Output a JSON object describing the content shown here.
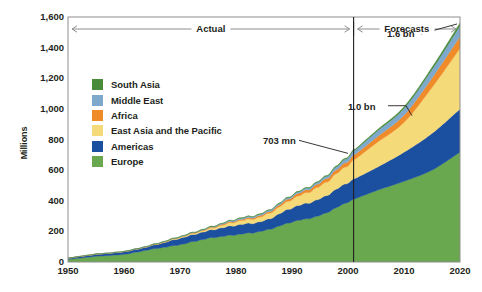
{
  "chart_data": {
    "type": "area",
    "title": "",
    "subtitle": "",
    "xlabel": "",
    "ylabel": "Millions",
    "xlim": [
      1950,
      2020
    ],
    "ylim": [
      0,
      1600
    ],
    "grid": false,
    "stacked": true,
    "legend_position": "inside-upper-left",
    "x_tick_labels": [
      "1950",
      "1960",
      "1970",
      "1980",
      "1990",
      "2000",
      "2010",
      "2020"
    ],
    "x_ticks": [
      1950,
      1960,
      1970,
      1980,
      1990,
      2000,
      2010,
      2020
    ],
    "y_tick_labels": [
      "0",
      "200",
      "400",
      "600",
      "800",
      "1,000",
      "1,200",
      "1,400",
      "1,600"
    ],
    "y_ticks": [
      0,
      200,
      400,
      600,
      800,
      1000,
      1200,
      1400,
      1600
    ],
    "x": [
      1950,
      1955,
      1960,
      1965,
      1970,
      1975,
      1980,
      1985,
      1990,
      1995,
      2000,
      2005,
      2010,
      2015,
      2020
    ],
    "series": [
      {
        "name": "Europe",
        "color": "#6aa84f",
        "values": [
          16.8,
          36.8,
          50.4,
          83.7,
          113.0,
          153.9,
          178.5,
          204.3,
          261.5,
          304.1,
          392.5,
          465.0,
          527.0,
          600.0,
          717.0
        ]
      },
      {
        "name": "Americas",
        "color": "#1b4fa0",
        "values": [
          7.5,
          12.8,
          16.7,
          23.2,
          42.3,
          50.0,
          62.3,
          65.1,
          92.8,
          109.0,
          128.2,
          150.0,
          190.0,
          240.0,
          282.0
        ]
      },
      {
        "name": "East Asia and the Pacific",
        "color": "#f5da7a",
        "values": [
          0.2,
          0.6,
          0.9,
          2.1,
          6.2,
          10.2,
          23.0,
          32.9,
          56.2,
          82.4,
          114.9,
          160.0,
          195.0,
          300.0,
          397.0
        ]
      },
      {
        "name": "Africa",
        "color": "#f08b2a",
        "values": [
          0.5,
          0.8,
          0.8,
          1.4,
          2.4,
          4.7,
          7.2,
          9.7,
          15.2,
          20.4,
          28.3,
          37.0,
          47.0,
          62.0,
          77.0
        ]
      },
      {
        "name": "Middle East",
        "color": "#7fa9cc",
        "values": [
          0.2,
          0.3,
          0.6,
          1.3,
          1.9,
          3.5,
          7.5,
          9.0,
          10.0,
          14.0,
          25.2,
          36.0,
          44.0,
          55.0,
          69.0
        ]
      },
      {
        "name": "South Asia",
        "color": "#4a8b3b",
        "values": [
          0.2,
          0.3,
          0.3,
          0.6,
          0.9,
          1.8,
          2.2,
          2.5,
          3.2,
          4.2,
          6.1,
          8.0,
          11.0,
          14.0,
          19.0
        ]
      }
    ],
    "annotations": [
      {
        "label": "703 mn",
        "x": 2000,
        "y": 703
      },
      {
        "label": "1.0 bn",
        "x": 2010,
        "y": 1014
      },
      {
        "label": "1.6 bn",
        "x": 2020,
        "y": 1561
      }
    ],
    "period_spans": [
      {
        "label": "Actual",
        "from": 1950,
        "to": 2001
      },
      {
        "label": "Forecasts",
        "from": 2001,
        "to": 2020
      }
    ],
    "divider_year": 2001
  },
  "legend": {
    "items": [
      {
        "label": "South Asia",
        "color": "#4a8b3b"
      },
      {
        "label": "Middle East",
        "color": "#7fa9cc"
      },
      {
        "label": "Africa",
        "color": "#f08b2a"
      },
      {
        "label": "East Asia and the Pacific",
        "color": "#f5da7a"
      },
      {
        "label": "Americas",
        "color": "#1b4fa0"
      },
      {
        "label": "Europe",
        "color": "#6aa84f"
      }
    ]
  },
  "axes": {
    "y_title": "Millions"
  },
  "spans": {
    "actual_label": "Actual",
    "forecasts_label": "Forecasts"
  },
  "callouts": {
    "c703": "703 mn",
    "c10bn": "1.0 bn",
    "c16bn": "1.6 bn"
  }
}
